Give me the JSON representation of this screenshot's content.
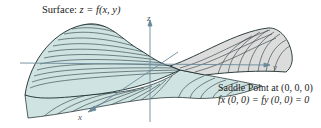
{
  "figure": {
    "title_prefix": "Surface:",
    "title_equation": "z = f(x, y)",
    "annotation_line1": "Saddle Point at (0, 0, 0)",
    "annotation_line2": "fx (0, 0) = fy (0, 0) = 0",
    "axes": {
      "x": "x",
      "y": "y",
      "z": "z"
    },
    "colors": {
      "surface_fill": "#cfe3e3",
      "surface_shade": "#dcdcdc",
      "contour": "#2b3a3a",
      "axis": "#6a8a9a"
    }
  }
}
